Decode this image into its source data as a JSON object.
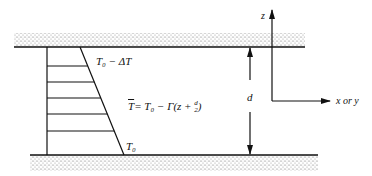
{
  "diagram": {
    "top_label": "T₀ − ΔT",
    "bottom_label": "T₀",
    "equation": "T̄̄ = T₀ − Γ(z + d⁄2)",
    "equation_parts": {
      "lhs": "T",
      "rhs": "= T₀ − Γ(z + ",
      "frac_num": "d",
      "frac_den": "2",
      "close": ")"
    },
    "gap_label": "d",
    "z_axis_label": "z",
    "x_axis_label": "x or y",
    "colors": {
      "ink": "#111111",
      "stipple": "#9a9a9a",
      "background": "#ffffff"
    }
  }
}
